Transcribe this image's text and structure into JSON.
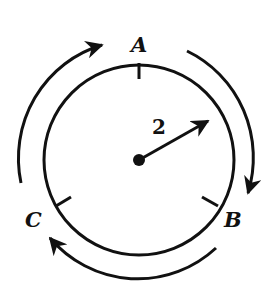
{
  "diagram": {
    "type": "circular track with direction arrows",
    "labels": {
      "point_a": "A",
      "point_b": "B",
      "point_c": "C",
      "radius_value": "2"
    },
    "circle": {
      "cx": 139,
      "cy": 160,
      "r": 95
    },
    "points": [
      {
        "name": "A",
        "angle_deg": 90
      },
      {
        "name": "B",
        "angle_deg": -30
      },
      {
        "name": "C",
        "angle_deg": 210
      }
    ],
    "direction": "clockwise",
    "colors": {
      "stroke": "#111111",
      "background": "#ffffff"
    }
  }
}
